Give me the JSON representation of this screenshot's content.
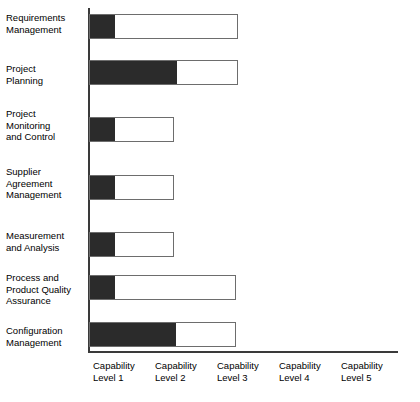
{
  "chart_data": {
    "type": "bar",
    "orientation": "horizontal",
    "stacked": true,
    "title": "",
    "subtitle": "",
    "xlabel": "",
    "ylabel": "",
    "xlim": [
      0,
      5
    ],
    "grid": false,
    "legend_position": "none",
    "colors": {
      "achieved": "#2b2b2b",
      "remaining": "#ffffff",
      "outline": "#6d6d6d",
      "axis": "#3a3a3a"
    },
    "xtick_labels": [
      "Capability\nLevel 1",
      "Capability\nLevel 2",
      "Capability\nLevel 3",
      "Capability\nLevel 4",
      "Capability\nLevel 5"
    ],
    "categories": [
      "Requirements\nManagement",
      "Project\nPlanning",
      "Project\nMonitoring\nand Control",
      "Supplier\nAgreement\nManagement",
      "Measurement\nand Analysis",
      "Process and\nProduct Quality\nAssurance",
      "Configuration\nManagement"
    ],
    "series": [
      {
        "name": "Achieved",
        "values": [
          0.42,
          1.42,
          0.42,
          0.42,
          0.42,
          0.42,
          1.4
        ]
      },
      {
        "name": "Target",
        "values": [
          2.42,
          2.42,
          1.37,
          1.37,
          1.37,
          2.39,
          2.39
        ]
      }
    ],
    "bars": [
      {
        "label": "Requirements\nManagement",
        "achieved": 0.42,
        "total": 2.42,
        "top": 14,
        "filled_px": 25,
        "total_px": 149
      },
      {
        "label": "Project\nPlanning",
        "achieved": 1.42,
        "total": 2.42,
        "top": 60,
        "filled_px": 87,
        "total_px": 149
      },
      {
        "label": "Project\nMonitoring\nand Control",
        "achieved": 0.42,
        "total": 1.37,
        "top": 117,
        "filled_px": 25,
        "total_px": 85
      },
      {
        "label": "Supplier\nAgreement\nManagement",
        "achieved": 0.42,
        "total": 1.37,
        "top": 175,
        "filled_px": 25,
        "total_px": 85
      },
      {
        "label": "Measurement\nand Analysis",
        "achieved": 0.42,
        "total": 1.37,
        "top": 232,
        "filled_px": 25,
        "total_px": 85
      },
      {
        "label": "Process and\nProduct Quality\nAssurance",
        "achieved": 0.42,
        "total": 2.39,
        "top": 275,
        "filled_px": 25,
        "total_px": 147
      },
      {
        "label": "Configuration\nManagement",
        "achieved": 1.4,
        "total": 2.39,
        "top": 322,
        "filled_px": 86,
        "total_px": 147
      }
    ]
  }
}
